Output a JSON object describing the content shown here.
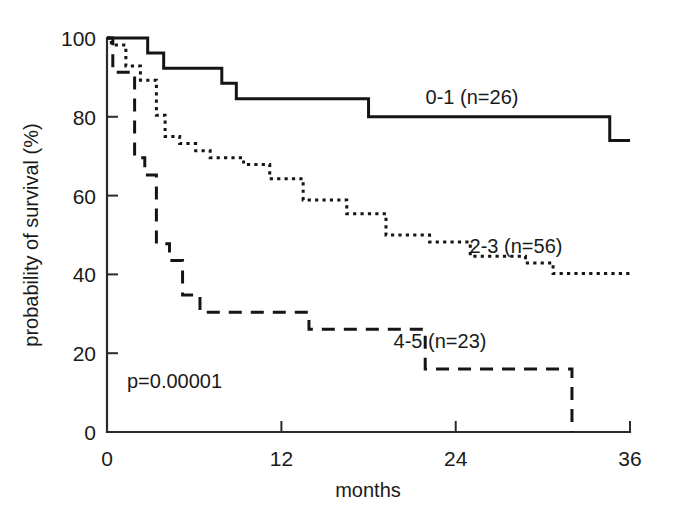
{
  "figure": {
    "title": "",
    "background_color": "#ffffff",
    "line_color": "#151515"
  },
  "axes": {
    "y": {
      "label": "probability of survival (%)",
      "ticks": [
        0,
        20,
        40,
        60,
        80,
        100
      ],
      "tick_labels": [
        "0",
        "20",
        "40",
        "60",
        "80",
        "100"
      ],
      "range": [
        0,
        100
      ]
    },
    "x": {
      "label": "months",
      "ticks": [
        0,
        12,
        24,
        36
      ],
      "tick_labels": [
        "0",
        "12",
        "24",
        "36"
      ],
      "range": [
        0,
        36
      ]
    }
  },
  "annotations": {
    "pvalue": "p=0.00001",
    "series_labels": [
      {
        "text": "0-1 (n=26)",
        "x_px": 472,
        "y_px": 104
      },
      {
        "text": "2-3 (n=56)",
        "x_px": 516,
        "y_px": 253
      },
      {
        "text": "4-5 (n=23)",
        "x_px": 440,
        "y_px": 348
      }
    ]
  },
  "chart_data": {
    "type": "line",
    "title": "",
    "xlabel": "months",
    "ylabel": "probability of survival (%)",
    "xlim": [
      0,
      36
    ],
    "ylim": [
      0,
      100
    ],
    "grid": false,
    "legend_position": "inline-annotations",
    "curve_style": "step-post (Kaplan-Meier)",
    "pvalue": "p=0.00001",
    "series": [
      {
        "name": "0-1 (n=26)",
        "label": "0-1 (n=26)",
        "n": 26,
        "linestyle": "solid",
        "x": [
          0.0,
          2.8,
          2.8,
          3.9,
          3.9,
          7.9,
          7.9,
          8.9,
          8.9,
          18.0,
          18.0,
          34.6,
          34.6,
          36.0
        ],
        "y": [
          100,
          100,
          96.2,
          96.2,
          92.3,
          92.3,
          88.5,
          88.5,
          84.6,
          84.6,
          80.0,
          80.0,
          74.0,
          74.0
        ]
      },
      {
        "name": "2-3 (n=56)",
        "label": "2-3 (n=56)",
        "n": 56,
        "linestyle": "dotted",
        "x": [
          0.0,
          0.3,
          0.3,
          1.3,
          1.3,
          2.3,
          2.3,
          3.4,
          3.4,
          4.0,
          4.0,
          5.0,
          5.0,
          6.1,
          6.1,
          7.1,
          7.1,
          9.4,
          9.4,
          11.2,
          11.2,
          13.5,
          13.5,
          16.5,
          16.5,
          19.2,
          19.2,
          22.2,
          22.2,
          25.0,
          25.0,
          28.8,
          28.8,
          30.7,
          30.7,
          36.0
        ],
        "y": [
          100,
          100,
          98.2,
          98.2,
          92.9,
          92.9,
          89.3,
          89.3,
          80.4,
          80.4,
          75.0,
          75.0,
          73.2,
          73.2,
          71.4,
          71.4,
          69.6,
          69.6,
          67.9,
          67.9,
          64.3,
          64.3,
          58.9,
          58.9,
          55.4,
          55.4,
          50.0,
          50.0,
          48.2,
          48.2,
          44.6,
          44.6,
          42.9,
          42.9,
          40.2,
          40.2
        ]
      },
      {
        "name": "4-5 (n=23)",
        "label": "4-5 (n=23)",
        "n": 23,
        "linestyle": "dashed",
        "x": [
          0.0,
          0.4,
          0.4,
          1.9,
          1.9,
          2.6,
          2.6,
          3.4,
          3.4,
          4.3,
          4.3,
          5.2,
          5.2,
          6.4,
          6.4,
          13.9,
          13.9,
          21.9,
          21.9,
          32.0,
          32.0
        ],
        "y": [
          100,
          100,
          91.3,
          91.3,
          69.6,
          69.6,
          65.2,
          65.2,
          47.8,
          47.8,
          43.5,
          43.5,
          34.8,
          34.8,
          30.4,
          30.4,
          26.1,
          26.1,
          16.0,
          16.0,
          0.0
        ]
      }
    ]
  },
  "geometry": {
    "origin_px": {
      "x": 107,
      "y": 432
    },
    "x_axis_end_px": 630,
    "y_axis_top_px": 38,
    "px_per_month": 14.53,
    "px_per_percent": 3.94
  }
}
